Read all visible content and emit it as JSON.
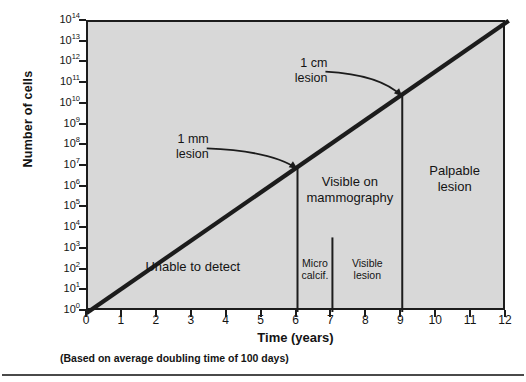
{
  "chart_data": {
    "type": "line",
    "title": "",
    "xlabel": "Time (years)",
    "ylabel": "Number of cells",
    "xlim": [
      0,
      12
    ],
    "ylim_exponent": [
      0,
      14
    ],
    "grid": false,
    "legend_position": "none",
    "x_ticks": [
      "0",
      "1",
      "2",
      "3",
      "4",
      "5",
      "6",
      "7",
      "8",
      "9",
      "10",
      "11",
      "12"
    ],
    "y_ticks": [
      {
        "mantissa": "10",
        "exponent": "14"
      },
      {
        "mantissa": "10",
        "exponent": "13"
      },
      {
        "mantissa": "10",
        "exponent": "12"
      },
      {
        "mantissa": "10",
        "exponent": "11"
      },
      {
        "mantissa": "10",
        "exponent": "10"
      },
      {
        "mantissa": "10",
        "exponent": "9"
      },
      {
        "mantissa": "10",
        "exponent": "8"
      },
      {
        "mantissa": "10",
        "exponent": "7"
      },
      {
        "mantissa": "10",
        "exponent": "6"
      },
      {
        "mantissa": "10",
        "exponent": "5"
      },
      {
        "mantissa": "10",
        "exponent": "4"
      },
      {
        "mantissa": "10",
        "exponent": "3"
      },
      {
        "mantissa": "10",
        "exponent": "2"
      },
      {
        "mantissa": "10",
        "exponent": "1"
      },
      {
        "mantissa": "10",
        "exponent": "0"
      }
    ],
    "series": [
      {
        "name": "Tumor cell growth",
        "x": [
          0,
          12
        ],
        "y_exponent": [
          0,
          14
        ],
        "color": "#1c1c1c"
      }
    ],
    "footnote": "(Based on average doubling time of 100 days)",
    "plot_background": "#d8d8d8",
    "axis_color": "#1c1c1c",
    "dividers": [
      {
        "x": 6,
        "from_curve": true,
        "label": "mammography-threshold"
      },
      {
        "x": 7,
        "y_exponent_top": 3.6,
        "label": "microcalcification-boundary"
      },
      {
        "x": 9,
        "from_curve": true,
        "label": "palpable-threshold"
      }
    ],
    "regions": [
      {
        "name": "unable-to-detect",
        "label": "Unable to detect",
        "x_center": 3.0,
        "y_exponent_center": 1.9,
        "size": "big"
      },
      {
        "name": "visible-on-mammography",
        "label": "Visible on\nmammography",
        "x_center": 7.5,
        "y_exponent_center": 6.0,
        "size": "big"
      },
      {
        "name": "palpable-lesion",
        "label": "Palpable\nlesion",
        "x_center": 10.5,
        "y_exponent_center": 6.5,
        "size": "big"
      },
      {
        "name": "micro-calcification",
        "label": "Micro\ncalcif.",
        "x_center": 6.5,
        "y_exponent_center": 2.0,
        "size": "small"
      },
      {
        "name": "visible-lesion",
        "label": "Visible\nlesion",
        "x_center": 8.0,
        "y_exponent_center": 2.0,
        "size": "small"
      }
    ],
    "annotations": [
      {
        "name": "one-mm-lesion",
        "label": "1 mm\nlesion",
        "text_x": 3.4,
        "text_y_exponent": 7.9,
        "point_x": 6.0,
        "point_y_exponent": 6.9
      },
      {
        "name": "one-cm-lesion",
        "label": "1 cm\nlesion",
        "text_x": 6.8,
        "text_y_exponent": 11.6,
        "point_x": 9.0,
        "point_y_exponent": 10.4
      }
    ]
  },
  "figure": {
    "axis_title_y": "Number of cells",
    "axis_title_x": "Time (years)",
    "footnote": "(Based on average doubling time of 100 days)"
  }
}
